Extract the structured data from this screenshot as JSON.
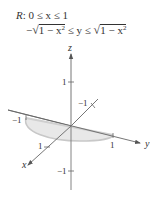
{
  "region": {
    "line1": {
      "prefix": "R",
      "text": ": 0 ≤ x ≤ 1"
    },
    "line2": {
      "lower_sign": "−",
      "lower_radicand_a": "1 − x",
      "exp": "2",
      "middle": " ≤ y ≤ ",
      "upper_radicand_a": "1 − x"
    }
  },
  "axes": {
    "x_label": "x",
    "y_label": "y",
    "z_label": "z"
  },
  "ticks": {
    "z_pos": "1",
    "z_neg": "−1",
    "x_neg": "−1",
    "x_pos": "1",
    "y_neg": "−1",
    "y_pos": "1"
  },
  "colors": {
    "axis": "#555555",
    "region_fill": "#e6e6e6",
    "region_edge": "#cfcfcf",
    "text": "#333333"
  }
}
